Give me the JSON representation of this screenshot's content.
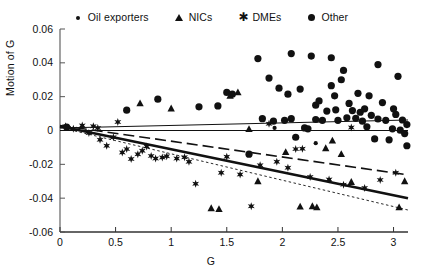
{
  "figure": {
    "xlabel": "G",
    "ylabel": "Motion of G"
  },
  "legend": {
    "position": "top-center",
    "items": [
      {
        "label": "Oil exporters",
        "marker": "small-dot-icon"
      },
      {
        "label": "NICs",
        "marker": "triangle-icon"
      },
      {
        "label": "DMEs",
        "marker": "star-icon"
      },
      {
        "label": "Other",
        "marker": "large-dot-icon"
      }
    ]
  },
  "axes": {
    "x_ticks": [
      "0",
      "0.5",
      "1",
      "1.5",
      "2",
      "2.5",
      "3"
    ],
    "y_ticks": [
      "0.06",
      "0.04",
      "0.02",
      "0",
      "-0.02",
      "-0.04",
      "-0.06"
    ]
  },
  "chart_data": {
    "type": "scatter",
    "title": "",
    "xlabel": "G",
    "ylabel": "Motion of G",
    "xlim": [
      0,
      3.13
    ],
    "ylim": [
      -0.06,
      0.06
    ],
    "xticks": [
      0,
      0.5,
      1,
      1.5,
      2,
      2.5,
      3
    ],
    "yticks": [
      -0.06,
      -0.04,
      -0.02,
      0,
      0.02,
      0.04,
      0.06
    ],
    "grid": false,
    "legend_position": "top-center",
    "series": [
      {
        "name": "Oil exporters",
        "marker": "small-dot",
        "points": [
          [
            1.93,
            0.0015
          ],
          [
            2.3,
            -0.0075
          ]
        ]
      },
      {
        "name": "NICs",
        "marker": "triangle",
        "points": [
          [
            0.72,
            0.016
          ],
          [
            1.0,
            0.013
          ],
          [
            1.36,
            -0.046
          ],
          [
            1.43,
            -0.0465
          ],
          [
            1.53,
            0.0205
          ],
          [
            1.6,
            0.0225
          ],
          [
            1.7,
            0.0008
          ],
          [
            1.78,
            -0.03
          ],
          [
            2.03,
            -0.0128
          ],
          [
            2.16,
            -0.045
          ],
          [
            2.27,
            -0.0448
          ],
          [
            2.31,
            -0.0455
          ],
          [
            2.39,
            -0.0105
          ],
          [
            2.45,
            -0.006
          ],
          [
            2.53,
            -0.014
          ],
          [
            2.62,
            -0.0305
          ],
          [
            3.05,
            -0.0455
          ],
          [
            3.1,
            -0.03
          ]
        ]
      },
      {
        "name": "DMEs",
        "marker": "star",
        "points": [
          [
            0.05,
            0.0025
          ],
          [
            0.12,
            0.001
          ],
          [
            0.2,
            0.003
          ],
          [
            0.26,
            -0.0015
          ],
          [
            0.3,
            0.0025
          ],
          [
            0.34,
            0.0015
          ],
          [
            0.36,
            -0.0055
          ],
          [
            0.42,
            -0.009
          ],
          [
            0.48,
            -0.004
          ],
          [
            0.52,
            0.005
          ],
          [
            0.56,
            -0.013
          ],
          [
            0.6,
            -0.011
          ],
          [
            0.64,
            -0.0168
          ],
          [
            0.7,
            -0.014
          ],
          [
            0.74,
            -0.012
          ],
          [
            0.78,
            -0.0095
          ],
          [
            0.82,
            -0.015
          ],
          [
            0.86,
            -0.0165
          ],
          [
            0.92,
            -0.016
          ],
          [
            0.96,
            -0.0152
          ],
          [
            1.05,
            -0.0165
          ],
          [
            1.12,
            -0.0158
          ],
          [
            1.16,
            -0.0185
          ],
          [
            1.22,
            -0.0315
          ],
          [
            1.45,
            -0.025
          ],
          [
            1.5,
            -0.0155
          ],
          [
            1.62,
            -0.026
          ],
          [
            1.72,
            -0.0448
          ],
          [
            1.8,
            -0.0205
          ],
          [
            1.88,
            0.004
          ],
          [
            1.95,
            -0.0185
          ],
          [
            2.05,
            -0.022
          ],
          [
            2.12,
            -0.011
          ],
          [
            2.18,
            -0.0108
          ],
          [
            2.25,
            -0.0275
          ],
          [
            2.42,
            -0.029
          ],
          [
            2.55,
            -0.032
          ],
          [
            2.62,
            0.0018
          ],
          [
            2.74,
            -0.034
          ],
          [
            2.88,
            -0.0292
          ],
          [
            3.02,
            -0.025
          ]
        ]
      },
      {
        "name": "Other",
        "marker": "large-dot",
        "points": [
          [
            0.06,
            0.002
          ],
          [
            0.6,
            0.012
          ],
          [
            0.88,
            0.0185
          ],
          [
            1.25,
            0.014
          ],
          [
            1.42,
            0.0145
          ],
          [
            1.7,
            -0.014
          ],
          [
            1.78,
            0.0425
          ],
          [
            1.82,
            0.007
          ],
          [
            1.88,
            0.031
          ],
          [
            1.92,
            0.0055
          ],
          [
            1.97,
            0.025
          ],
          [
            2.02,
            0.006
          ],
          [
            2.05,
            0.0215
          ],
          [
            2.08,
            0.007
          ],
          [
            2.12,
            -0.004
          ],
          [
            2.16,
            0.0245
          ],
          [
            2.2,
            0.0015
          ],
          [
            2.23,
            0.001
          ],
          [
            2.26,
            0.044
          ],
          [
            2.3,
            0.015
          ],
          [
            2.33,
            0.0175
          ],
          [
            2.36,
            0.006
          ],
          [
            2.4,
            0.0115
          ],
          [
            2.44,
            0.0265
          ],
          [
            2.47,
            0.0205
          ],
          [
            2.5,
            0.006
          ],
          [
            2.53,
            0.03
          ],
          [
            2.55,
            0.0355
          ],
          [
            2.58,
            0.0075
          ],
          [
            2.6,
            0.016
          ],
          [
            2.63,
            0.0118
          ],
          [
            2.66,
            0.0072
          ],
          [
            2.68,
            0.022
          ],
          [
            2.7,
            0.0108
          ],
          [
            2.72,
            0.0055
          ],
          [
            2.74,
            0.0128
          ],
          [
            2.76,
            0.0022
          ],
          [
            2.78,
            0.0205
          ],
          [
            2.8,
            0.009
          ],
          [
            2.83,
            -0.005
          ],
          [
            2.86,
            0.039
          ],
          [
            2.9,
            0.0165
          ],
          [
            2.93,
            0.006
          ],
          [
            2.96,
            -0.0055
          ],
          [
            2.99,
            0.001
          ],
          [
            3.02,
            0.0095
          ],
          [
            3.04,
            0.032
          ],
          [
            3.06,
            0.0002
          ],
          [
            3.08,
            0.0062
          ],
          [
            3.1,
            -0.0018
          ],
          [
            3.12,
            -0.009
          ],
          [
            3.12,
            0.0035
          ],
          [
            1.5,
            0.0225
          ],
          [
            2.08,
            0.0455
          ],
          [
            2.44,
            0.043
          ],
          [
            2.48,
            0.0122
          ],
          [
            1.55,
            0.0215
          ],
          [
            2.3,
            0.0065
          ],
          [
            2.86,
            0.0068
          ],
          [
            3.0,
            0.0128
          ]
        ]
      }
    ],
    "trend_lines": [
      {
        "name": "flat-solid-thin",
        "style": "solid",
        "width": 1.1,
        "x0": 0.0,
        "y0": 0.0015,
        "x1": 3.13,
        "y1": 0.0062
      },
      {
        "name": "dashed",
        "style": "dashed",
        "width": 1.6,
        "x0": 0.0,
        "y0": 0.003,
        "x1": 3.13,
        "y1": -0.0262
      },
      {
        "name": "thick-solid",
        "style": "solid",
        "width": 2.6,
        "x0": 0.0,
        "y0": 0.0025,
        "x1": 3.13,
        "y1": -0.04
      },
      {
        "name": "dotted-thin",
        "style": "dotted",
        "width": 0.9,
        "x0": 0.0,
        "y0": 0.0018,
        "x1": 3.13,
        "y1": -0.047
      },
      {
        "name": "zero-baseline",
        "style": "solid",
        "width": 1.0,
        "x0": 0.0,
        "y0": 0.0,
        "x1": 3.13,
        "y1": 0.0
      }
    ]
  }
}
